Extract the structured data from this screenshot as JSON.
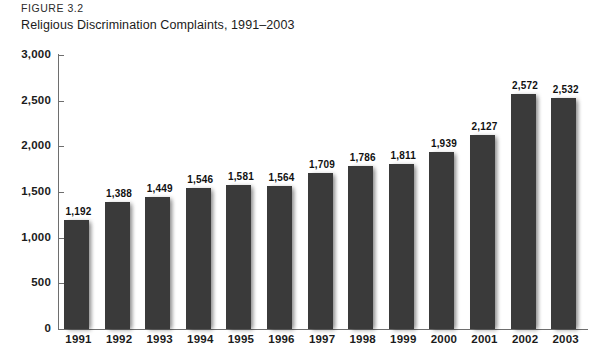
{
  "header": {
    "figure_label": "FIGURE 3.2",
    "title": "Religious Discrimination Complaints, 1991–2003"
  },
  "chart_data": {
    "type": "bar",
    "title": "Religious Discrimination Complaints, 1991–2003",
    "xlabel": "",
    "ylabel": "",
    "ylim": [
      0,
      3000
    ],
    "grid": false,
    "legend": false,
    "bar_color": "#3a3a3a",
    "axis_color": "#6e6e6e",
    "ytick_labels": [
      "3,000",
      "2,500",
      "2,000",
      "1,500",
      "1,000",
      "500",
      "0"
    ],
    "yticks": [
      3000,
      2500,
      2000,
      1500,
      1000,
      500,
      0
    ],
    "categories": [
      "1991",
      "1992",
      "1993",
      "1994",
      "1995",
      "1996",
      "1997",
      "1998",
      "1999",
      "2000",
      "2001",
      "2002",
      "2003"
    ],
    "values": [
      1192,
      1388,
      1449,
      1546,
      1581,
      1564,
      1709,
      1786,
      1811,
      1939,
      2127,
      2572,
      2532
    ],
    "value_labels": [
      "1,192",
      "1,388",
      "1,449",
      "1,546",
      "1,581",
      "1,564",
      "1,709",
      "1,786",
      "1,811",
      "1,939",
      "2,127",
      "2,572",
      "2,532"
    ]
  }
}
